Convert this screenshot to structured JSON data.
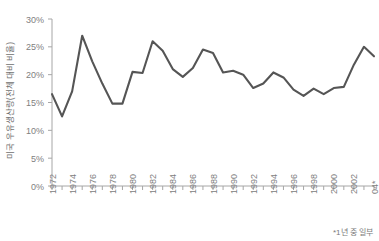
{
  "chart_data": {
    "type": "line",
    "title": "",
    "xlabel": "",
    "ylabel": "미국 우유생산량(전체 대비 비율)",
    "footnote": "*1년 중 일부",
    "grid": false,
    "legend": "none",
    "line_color": "#555555",
    "axis_color": "#a6a6a6",
    "text_color": "#808080",
    "ylim": [
      0,
      30
    ],
    "yticks": [
      0,
      5,
      10,
      15,
      20,
      25,
      30
    ],
    "ytick_labels": [
      "0%",
      "5%",
      "10%",
      "15%",
      "20%",
      "25%",
      "30%"
    ],
    "xlim": [
      1972,
      2004
    ],
    "xticks": [
      1972,
      1973,
      1974,
      1975,
      1976,
      1977,
      1978,
      1979,
      1980,
      1981,
      1982,
      1983,
      1984,
      1985,
      1986,
      1987,
      1988,
      1989,
      1990,
      1991,
      1992,
      1993,
      1994,
      1995,
      1996,
      1997,
      1998,
      1999,
      2000,
      2001,
      2002,
      2003,
      2004
    ],
    "xtick_labels": [
      "1972",
      "",
      "1974",
      "",
      "1976",
      "",
      "1978",
      "",
      "1980",
      "",
      "1982",
      "",
      "1984",
      "",
      "1986",
      "",
      "1988",
      "",
      "1990",
      "",
      "1992",
      "",
      "1994",
      "",
      "1996",
      "",
      "1998",
      "",
      "2000",
      "",
      "2002",
      "",
      "04*"
    ],
    "x": [
      1972,
      1973,
      1974,
      1975,
      1976,
      1977,
      1978,
      1979,
      1980,
      1981,
      1982,
      1983,
      1984,
      1985,
      1986,
      1987,
      1988,
      1989,
      1990,
      1991,
      1992,
      1993,
      1994,
      1995,
      1996,
      1997,
      1998,
      1999,
      2000,
      2001,
      2002,
      2003,
      2004
    ],
    "values": [
      16.5,
      12.5,
      17.0,
      27.0,
      22.4,
      18.4,
      14.8,
      14.8,
      20.5,
      20.3,
      26.0,
      24.3,
      21.0,
      19.6,
      21.2,
      24.5,
      23.9,
      20.4,
      20.7,
      20.0,
      17.6,
      18.4,
      20.4,
      19.5,
      17.3,
      16.2,
      17.5,
      16.5,
      17.6,
      17.8,
      21.8,
      25.0,
      23.3
    ]
  }
}
